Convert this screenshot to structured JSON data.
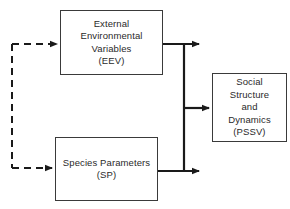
{
  "diagram": {
    "nodes": {
      "eev": {
        "lines": [
          "External",
          "Environmental",
          "Variables",
          "(EEV)"
        ]
      },
      "sp": {
        "lines": [
          "Species Parameters",
          "(SP)"
        ]
      },
      "pssv": {
        "lines": [
          "Social",
          "Structure",
          "and",
          "Dynamics",
          "(PSSV)"
        ]
      }
    },
    "edges": [
      {
        "from": "eev",
        "to": "pssv",
        "style": "solid"
      },
      {
        "from": "sp",
        "to": "pssv",
        "style": "solid"
      },
      {
        "from": "feedback",
        "to": "eev",
        "style": "dashed"
      },
      {
        "from": "feedback",
        "to": "sp",
        "style": "dashed"
      }
    ],
    "colors": {
      "line": "#1a1a1a",
      "box_border": "#3a3a3a",
      "text": "#2a2a2a"
    }
  }
}
